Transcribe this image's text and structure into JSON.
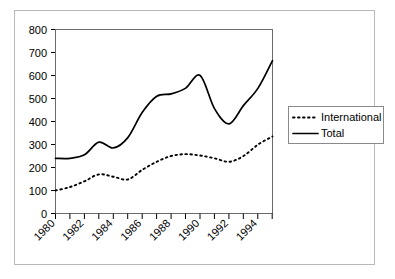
{
  "chart_data": {
    "type": "line",
    "title": "",
    "xlabel": "",
    "ylabel": "",
    "xlim": [
      1980,
      1995
    ],
    "ylim": [
      0,
      800
    ],
    "yticks": [
      0,
      100,
      200,
      300,
      400,
      500,
      600,
      700,
      800
    ],
    "xticks": [
      1980,
      1982,
      1984,
      1986,
      1988,
      1990,
      1992,
      1994
    ],
    "xtick_labels": [
      "1980",
      "1982",
      "1984",
      "1986",
      "1988",
      "1990",
      "1992",
      "1994"
    ],
    "ytick_labels": [
      "0",
      "100",
      "200",
      "300",
      "400",
      "500",
      "600",
      "700",
      "800"
    ],
    "grid": false,
    "legend_position": "right",
    "x": [
      1980,
      1981,
      1982,
      1983,
      1984,
      1985,
      1986,
      1987,
      1988,
      1989,
      1990,
      1991,
      1992,
      1993,
      1994,
      1995
    ],
    "series": [
      {
        "name": "International",
        "style": "dotted",
        "color": "#000000",
        "values": [
          100,
          115,
          140,
          170,
          160,
          148,
          190,
          225,
          250,
          258,
          252,
          240,
          225,
          250,
          300,
          335
        ]
      },
      {
        "name": "Total",
        "style": "solid",
        "color": "#000000",
        "values": [
          240,
          240,
          255,
          310,
          285,
          330,
          440,
          510,
          520,
          545,
          600,
          455,
          390,
          470,
          545,
          665
        ]
      }
    ]
  },
  "legend": {
    "entries": [
      {
        "label": "International",
        "style": "dotted"
      },
      {
        "label": "Total",
        "style": "solid"
      }
    ]
  },
  "axes": {
    "y_labels": [
      "800",
      "700",
      "600",
      "500",
      "400",
      "300",
      "200",
      "100",
      "0"
    ],
    "x_labels": [
      "1980",
      "1982",
      "1984",
      "1986",
      "1988",
      "1990",
      "1992",
      "1994"
    ]
  }
}
